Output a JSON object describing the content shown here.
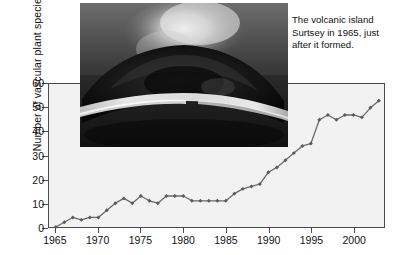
{
  "figure": {
    "caption_text": "The volcanic island Surtsey in 1965, just after it formed.",
    "photo_alt": "surtsey-aerial-photo"
  },
  "chart_data": {
    "type": "line",
    "title": "",
    "xlabel": "",
    "ylabel": "Number of vascular plant species",
    "xlim": [
      1964.2,
      2003.6
    ],
    "ylim": [
      0,
      60
    ],
    "grid": false,
    "legend": "none",
    "marker": "diamond",
    "line_color": "#6b6b6b",
    "marker_color": "#5a5a5a",
    "x_tick_labels": [
      "1965",
      "1970",
      "1975",
      "1980",
      "1985",
      "1990",
      "1995",
      "2000"
    ],
    "x_tick_values": [
      1965,
      1970,
      1975,
      1980,
      1985,
      1990,
      1995,
      2000
    ],
    "y_tick_labels": [
      "0",
      "10",
      "20",
      "30",
      "40",
      "50",
      "60"
    ],
    "y_tick_values": [
      0,
      10,
      20,
      30,
      40,
      50,
      60
    ],
    "x": [
      1965,
      1966,
      1967,
      1968,
      1969,
      1970,
      1971,
      1972,
      1973,
      1974,
      1975,
      1976,
      1977,
      1978,
      1979,
      1980,
      1981,
      1982,
      1983,
      1984,
      1985,
      1986,
      1987,
      1988,
      1989,
      1990,
      1991,
      1992,
      1993,
      1994,
      1995,
      1996,
      1997,
      1998,
      1999,
      2000,
      2001,
      2002,
      2003
    ],
    "values": [
      0,
      2,
      4,
      3,
      4,
      4,
      7,
      10,
      12,
      10,
      13,
      11,
      10,
      13,
      13,
      13,
      11,
      11,
      11,
      11,
      11,
      14,
      16,
      17,
      18,
      23,
      25,
      28,
      31,
      34,
      35,
      45,
      47,
      45,
      47,
      47,
      46,
      50,
      53
    ],
    "series_name": "Vascular plant species on Surtsey"
  }
}
